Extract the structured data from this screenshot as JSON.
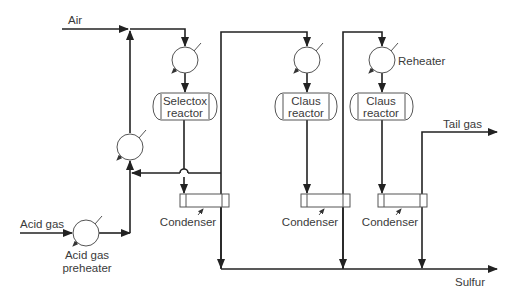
{
  "diagram": {
    "type": "process-flow",
    "streams": {
      "air": "Air",
      "acid_gas": "Acid gas",
      "tail_gas": "Tail gas",
      "sulfur": "Sulfur"
    },
    "equipment": {
      "acid_gas_preheater_line1": "Acid gas",
      "acid_gas_preheater_line2": "preheater",
      "reheater": "Reheater",
      "reactors": [
        {
          "line1": "Selectox",
          "line2": "reactor"
        },
        {
          "line1": "Claus",
          "line2": "reactor"
        },
        {
          "line1": "Claus",
          "line2": "reactor"
        }
      ],
      "condensers": [
        "Condenser",
        "Condenser",
        "Condenser"
      ]
    },
    "colors": {
      "line": "#222222",
      "equipment": "#555555",
      "text": "#3a3a3a",
      "background": "#ffffff"
    }
  }
}
